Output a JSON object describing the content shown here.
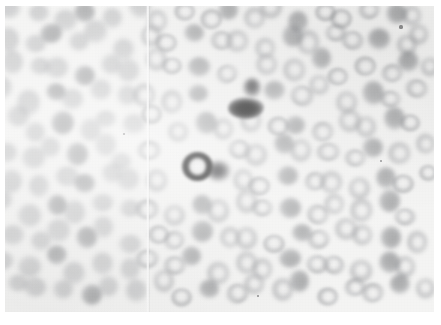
{
  "image": {
    "kind": "micrograph",
    "subject": "peripheral blood smear",
    "modality": "light microscopy, stained film",
    "rendering": "grayscale",
    "width_px": 441,
    "height_px": 325,
    "caption": "",
    "title": "",
    "visible_text": []
  },
  "colors": {
    "page_background": "#ffffff",
    "field_background": "#f7f7f6",
    "cell_light": "#9a9c9f",
    "cell_mid": "#7a7c80",
    "cell_dense": "#606266",
    "cell_dark": "#1b1b1b",
    "seam_highlight": "#ffffff"
  },
  "plate": {
    "left_px": 5,
    "top_px": 6,
    "width_px": 429,
    "height_px": 306,
    "margin_note": "thin white paper border on all four sides"
  },
  "artifacts": {
    "seam": {
      "name": "vertical-scan-seam",
      "x_px": 146,
      "width_px": 4,
      "description": "faint pale vertical crease running the full height of the plate"
    },
    "focus": "left third of the field is out of focus; right side is sharper",
    "specks": [
      {
        "x": 401,
        "y": 27,
        "r": 1.6
      },
      {
        "x": 381,
        "y": 161,
        "r": 1.3
      },
      {
        "x": 124,
        "y": 134,
        "r": 1.2
      },
      {
        "x": 258,
        "y": 296,
        "r": 1.4
      }
    ]
  },
  "features": {
    "dark_cells": [
      {
        "name": "upper-dark-cell",
        "label": "hyperchromic cell (upper)",
        "center_x": 246,
        "center_y": 108,
        "width": 36,
        "height": 22,
        "intensity": "near-black",
        "has_tail": true,
        "tail_x": 252,
        "tail_y": 88,
        "tail_w": 18,
        "tail_h": 20
      },
      {
        "name": "lower-dark-cell",
        "label": "hyperchromic ring cell (lower)",
        "center_x": 197,
        "center_y": 166,
        "width": 31,
        "height": 29,
        "intensity": "near-black with pale centre",
        "has_tail": true,
        "tail_x": 219,
        "tail_y": 171,
        "tail_w": 24,
        "tail_h": 20
      }
    ],
    "erythrocyte_count_visible": 168,
    "mean_cell_diameter_px": 21
  },
  "cells": [
    {
      "x": 14,
      "y": 14,
      "d": 22,
      "t": "soft"
    },
    {
      "x": 40,
      "y": 9,
      "d": 20,
      "t": "soft"
    },
    {
      "x": 62,
      "y": 18,
      "d": 23,
      "t": "soft"
    },
    {
      "x": 88,
      "y": 12,
      "d": 21,
      "t": "dense"
    },
    {
      "x": 112,
      "y": 20,
      "d": 20,
      "t": "soft"
    },
    {
      "x": 136,
      "y": 10,
      "d": 22,
      "t": "soft"
    },
    {
      "x": 160,
      "y": 16,
      "d": 20,
      "t": "ring"
    },
    {
      "x": 183,
      "y": 8,
      "d": 21,
      "t": "ring"
    },
    {
      "x": 206,
      "y": 18,
      "d": 22,
      "t": "ring"
    },
    {
      "x": 230,
      "y": 11,
      "d": 20,
      "t": "dense"
    },
    {
      "x": 252,
      "y": 20,
      "d": 21,
      "t": "ring"
    },
    {
      "x": 276,
      "y": 12,
      "d": 22,
      "t": "ring"
    },
    {
      "x": 299,
      "y": 18,
      "d": 20,
      "t": "dense"
    },
    {
      "x": 322,
      "y": 10,
      "d": 21,
      "t": "ring"
    },
    {
      "x": 345,
      "y": 19,
      "d": 22,
      "t": "ring"
    },
    {
      "x": 369,
      "y": 12,
      "d": 20,
      "t": "ring"
    },
    {
      "x": 392,
      "y": 17,
      "d": 21,
      "t": "dense"
    },
    {
      "x": 414,
      "y": 10,
      "d": 19,
      "t": "ring"
    },
    {
      "x": 6,
      "y": 36,
      "d": 23,
      "t": "soft"
    },
    {
      "x": 30,
      "y": 42,
      "d": 21,
      "t": "soft"
    },
    {
      "x": 53,
      "y": 34,
      "d": 22,
      "t": "dense"
    },
    {
      "x": 77,
      "y": 44,
      "d": 20,
      "t": "soft"
    },
    {
      "x": 100,
      "y": 36,
      "d": 23,
      "t": "soft"
    },
    {
      "x": 124,
      "y": 45,
      "d": 21,
      "t": "soft"
    },
    {
      "x": 148,
      "y": 34,
      "d": 20,
      "t": "ring"
    },
    {
      "x": 170,
      "y": 43,
      "d": 22,
      "t": "ring"
    },
    {
      "x": 194,
      "y": 35,
      "d": 20,
      "t": "dense"
    },
    {
      "x": 217,
      "y": 44,
      "d": 21,
      "t": "ring"
    },
    {
      "x": 240,
      "y": 36,
      "d": 22,
      "t": "ring"
    },
    {
      "x": 264,
      "y": 45,
      "d": 20,
      "t": "ring"
    },
    {
      "x": 287,
      "y": 34,
      "d": 21,
      "t": "dense"
    },
    {
      "x": 310,
      "y": 43,
      "d": 22,
      "t": "ring"
    },
    {
      "x": 334,
      "y": 36,
      "d": 20,
      "t": "ring"
    },
    {
      "x": 357,
      "y": 45,
      "d": 21,
      "t": "ring"
    },
    {
      "x": 380,
      "y": 35,
      "d": 22,
      "t": "dense"
    },
    {
      "x": 404,
      "y": 43,
      "d": 20,
      "t": "ring"
    },
    {
      "x": 422,
      "y": 34,
      "d": 19,
      "t": "ring"
    },
    {
      "x": 12,
      "y": 64,
      "d": 22,
      "t": "soft"
    },
    {
      "x": 36,
      "y": 70,
      "d": 20,
      "t": "soft"
    },
    {
      "x": 59,
      "y": 62,
      "d": 23,
      "t": "soft"
    },
    {
      "x": 83,
      "y": 72,
      "d": 21,
      "t": "dense"
    },
    {
      "x": 106,
      "y": 63,
      "d": 20,
      "t": "soft"
    },
    {
      "x": 130,
      "y": 71,
      "d": 22,
      "t": "soft"
    },
    {
      "x": 154,
      "y": 62,
      "d": 21,
      "t": "ring"
    },
    {
      "x": 177,
      "y": 71,
      "d": 20,
      "t": "ring"
    },
    {
      "x": 200,
      "y": 63,
      "d": 22,
      "t": "dense"
    },
    {
      "x": 224,
      "y": 72,
      "d": 20,
      "t": "ring"
    },
    {
      "x": 270,
      "y": 64,
      "d": 21,
      "t": "ring"
    },
    {
      "x": 294,
      "y": 72,
      "d": 22,
      "t": "ring"
    },
    {
      "x": 317,
      "y": 62,
      "d": 20,
      "t": "dense"
    },
    {
      "x": 340,
      "y": 71,
      "d": 21,
      "t": "ring"
    },
    {
      "x": 364,
      "y": 63,
      "d": 22,
      "t": "ring"
    },
    {
      "x": 387,
      "y": 72,
      "d": 20,
      "t": "ring"
    },
    {
      "x": 410,
      "y": 62,
      "d": 21,
      "t": "dense"
    },
    {
      "x": 428,
      "y": 70,
      "d": 18,
      "t": "ring"
    },
    {
      "x": 6,
      "y": 92,
      "d": 21,
      "t": "soft"
    },
    {
      "x": 29,
      "y": 98,
      "d": 23,
      "t": "soft"
    },
    {
      "x": 53,
      "y": 90,
      "d": 20,
      "t": "dense"
    },
    {
      "x": 76,
      "y": 99,
      "d": 22,
      "t": "soft"
    },
    {
      "x": 100,
      "y": 91,
      "d": 21,
      "t": "soft"
    },
    {
      "x": 123,
      "y": 99,
      "d": 20,
      "t": "soft"
    },
    {
      "x": 147,
      "y": 90,
      "d": 22,
      "t": "ring"
    },
    {
      "x": 170,
      "y": 98,
      "d": 21,
      "t": "ring"
    },
    {
      "x": 193,
      "y": 92,
      "d": 20,
      "t": "dense"
    },
    {
      "x": 276,
      "y": 91,
      "d": 21,
      "t": "dense"
    },
    {
      "x": 300,
      "y": 99,
      "d": 22,
      "t": "ring"
    },
    {
      "x": 324,
      "y": 90,
      "d": 20,
      "t": "ring"
    },
    {
      "x": 347,
      "y": 98,
      "d": 21,
      "t": "ring"
    },
    {
      "x": 370,
      "y": 91,
      "d": 22,
      "t": "dense"
    },
    {
      "x": 394,
      "y": 99,
      "d": 20,
      "t": "ring"
    },
    {
      "x": 416,
      "y": 90,
      "d": 21,
      "t": "ring"
    },
    {
      "x": 14,
      "y": 120,
      "d": 22,
      "t": "soft"
    },
    {
      "x": 38,
      "y": 127,
      "d": 20,
      "t": "soft"
    },
    {
      "x": 61,
      "y": 119,
      "d": 23,
      "t": "dense"
    },
    {
      "x": 85,
      "y": 128,
      "d": 21,
      "t": "soft"
    },
    {
      "x": 108,
      "y": 120,
      "d": 20,
      "t": "soft"
    },
    {
      "x": 132,
      "y": 127,
      "d": 22,
      "t": "soft"
    },
    {
      "x": 156,
      "y": 119,
      "d": 21,
      "t": "ring"
    },
    {
      "x": 179,
      "y": 128,
      "d": 20,
      "t": "ring"
    },
    {
      "x": 203,
      "y": 121,
      "d": 22,
      "t": "dense"
    },
    {
      "x": 227,
      "y": 129,
      "d": 20,
      "t": "ring"
    },
    {
      "x": 250,
      "y": 122,
      "d": 21,
      "t": "ring"
    },
    {
      "x": 274,
      "y": 130,
      "d": 22,
      "t": "ring"
    },
    {
      "x": 298,
      "y": 120,
      "d": 20,
      "t": "dense"
    },
    {
      "x": 321,
      "y": 128,
      "d": 21,
      "t": "ring"
    },
    {
      "x": 345,
      "y": 120,
      "d": 22,
      "t": "ring"
    },
    {
      "x": 368,
      "y": 128,
      "d": 20,
      "t": "ring"
    },
    {
      "x": 392,
      "y": 121,
      "d": 21,
      "t": "dense"
    },
    {
      "x": 415,
      "y": 128,
      "d": 20,
      "t": "ring"
    },
    {
      "x": 7,
      "y": 148,
      "d": 21,
      "t": "soft"
    },
    {
      "x": 30,
      "y": 155,
      "d": 23,
      "t": "soft"
    },
    {
      "x": 54,
      "y": 147,
      "d": 20,
      "t": "soft"
    },
    {
      "x": 77,
      "y": 156,
      "d": 22,
      "t": "dense"
    },
    {
      "x": 101,
      "y": 148,
      "d": 21,
      "t": "soft"
    },
    {
      "x": 124,
      "y": 156,
      "d": 20,
      "t": "soft"
    },
    {
      "x": 148,
      "y": 147,
      "d": 22,
      "t": "ring"
    },
    {
      "x": 234,
      "y": 148,
      "d": 21,
      "t": "ring"
    },
    {
      "x": 258,
      "y": 156,
      "d": 22,
      "t": "ring"
    },
    {
      "x": 282,
      "y": 147,
      "d": 20,
      "t": "dense"
    },
    {
      "x": 305,
      "y": 155,
      "d": 21,
      "t": "ring"
    },
    {
      "x": 329,
      "y": 148,
      "d": 22,
      "t": "ring"
    },
    {
      "x": 352,
      "y": 156,
      "d": 20,
      "t": "ring"
    },
    {
      "x": 376,
      "y": 147,
      "d": 21,
      "t": "dense"
    },
    {
      "x": 399,
      "y": 155,
      "d": 22,
      "t": "ring"
    },
    {
      "x": 421,
      "y": 147,
      "d": 19,
      "t": "ring"
    },
    {
      "x": 14,
      "y": 176,
      "d": 22,
      "t": "soft"
    },
    {
      "x": 38,
      "y": 183,
      "d": 20,
      "t": "soft"
    },
    {
      "x": 62,
      "y": 175,
      "d": 23,
      "t": "soft"
    },
    {
      "x": 86,
      "y": 184,
      "d": 21,
      "t": "dense"
    },
    {
      "x": 110,
      "y": 176,
      "d": 20,
      "t": "soft"
    },
    {
      "x": 133,
      "y": 184,
      "d": 22,
      "t": "soft"
    },
    {
      "x": 157,
      "y": 176,
      "d": 21,
      "t": "ring"
    },
    {
      "x": 240,
      "y": 178,
      "d": 20,
      "t": "ring"
    },
    {
      "x": 263,
      "y": 186,
      "d": 22,
      "t": "ring"
    },
    {
      "x": 287,
      "y": 177,
      "d": 21,
      "t": "dense"
    },
    {
      "x": 311,
      "y": 185,
      "d": 20,
      "t": "ring"
    },
    {
      "x": 334,
      "y": 177,
      "d": 22,
      "t": "ring"
    },
    {
      "x": 358,
      "y": 185,
      "d": 21,
      "t": "ring"
    },
    {
      "x": 381,
      "y": 177,
      "d": 20,
      "t": "dense"
    },
    {
      "x": 405,
      "y": 185,
      "d": 22,
      "t": "ring"
    },
    {
      "x": 426,
      "y": 176,
      "d": 18,
      "t": "ring"
    },
    {
      "x": 6,
      "y": 204,
      "d": 21,
      "t": "soft"
    },
    {
      "x": 30,
      "y": 211,
      "d": 23,
      "t": "soft"
    },
    {
      "x": 54,
      "y": 203,
      "d": 20,
      "t": "dense"
    },
    {
      "x": 78,
      "y": 212,
      "d": 22,
      "t": "soft"
    },
    {
      "x": 102,
      "y": 204,
      "d": 21,
      "t": "soft"
    },
    {
      "x": 126,
      "y": 212,
      "d": 20,
      "t": "soft"
    },
    {
      "x": 150,
      "y": 204,
      "d": 22,
      "t": "ring"
    },
    {
      "x": 173,
      "y": 212,
      "d": 21,
      "t": "ring"
    },
    {
      "x": 197,
      "y": 204,
      "d": 20,
      "t": "dense"
    },
    {
      "x": 220,
      "y": 212,
      "d": 22,
      "t": "ring"
    },
    {
      "x": 244,
      "y": 204,
      "d": 21,
      "t": "ring"
    },
    {
      "x": 267,
      "y": 213,
      "d": 20,
      "t": "ring"
    },
    {
      "x": 291,
      "y": 204,
      "d": 22,
      "t": "dense"
    },
    {
      "x": 314,
      "y": 212,
      "d": 21,
      "t": "ring"
    },
    {
      "x": 338,
      "y": 204,
      "d": 20,
      "t": "ring"
    },
    {
      "x": 361,
      "y": 212,
      "d": 22,
      "t": "ring"
    },
    {
      "x": 385,
      "y": 204,
      "d": 21,
      "t": "dense"
    },
    {
      "x": 408,
      "y": 212,
      "d": 20,
      "t": "ring"
    },
    {
      "x": 12,
      "y": 232,
      "d": 22,
      "t": "soft"
    },
    {
      "x": 36,
      "y": 240,
      "d": 20,
      "t": "soft"
    },
    {
      "x": 60,
      "y": 231,
      "d": 23,
      "t": "soft"
    },
    {
      "x": 84,
      "y": 240,
      "d": 21,
      "t": "dense"
    },
    {
      "x": 108,
      "y": 232,
      "d": 20,
      "t": "soft"
    },
    {
      "x": 131,
      "y": 240,
      "d": 22,
      "t": "soft"
    },
    {
      "x": 155,
      "y": 232,
      "d": 21,
      "t": "ring"
    },
    {
      "x": 178,
      "y": 240,
      "d": 20,
      "t": "ring"
    },
    {
      "x": 202,
      "y": 233,
      "d": 22,
      "t": "dense"
    },
    {
      "x": 226,
      "y": 241,
      "d": 20,
      "t": "ring"
    },
    {
      "x": 249,
      "y": 233,
      "d": 21,
      "t": "ring"
    },
    {
      "x": 273,
      "y": 241,
      "d": 22,
      "t": "ring"
    },
    {
      "x": 297,
      "y": 232,
      "d": 20,
      "t": "dense"
    },
    {
      "x": 320,
      "y": 240,
      "d": 21,
      "t": "ring"
    },
    {
      "x": 344,
      "y": 232,
      "d": 22,
      "t": "ring"
    },
    {
      "x": 367,
      "y": 240,
      "d": 20,
      "t": "ring"
    },
    {
      "x": 391,
      "y": 233,
      "d": 21,
      "t": "dense"
    },
    {
      "x": 414,
      "y": 240,
      "d": 20,
      "t": "ring"
    },
    {
      "x": 6,
      "y": 260,
      "d": 21,
      "t": "soft"
    },
    {
      "x": 29,
      "y": 268,
      "d": 23,
      "t": "soft"
    },
    {
      "x": 53,
      "y": 259,
      "d": 20,
      "t": "dense"
    },
    {
      "x": 77,
      "y": 268,
      "d": 22,
      "t": "soft"
    },
    {
      "x": 101,
      "y": 260,
      "d": 21,
      "t": "soft"
    },
    {
      "x": 125,
      "y": 268,
      "d": 20,
      "t": "soft"
    },
    {
      "x": 149,
      "y": 260,
      "d": 22,
      "t": "ring"
    },
    {
      "x": 172,
      "y": 268,
      "d": 21,
      "t": "ring"
    },
    {
      "x": 196,
      "y": 261,
      "d": 20,
      "t": "dense"
    },
    {
      "x": 219,
      "y": 269,
      "d": 22,
      "t": "ring"
    },
    {
      "x": 243,
      "y": 260,
      "d": 21,
      "t": "ring"
    },
    {
      "x": 266,
      "y": 269,
      "d": 20,
      "t": "ring"
    },
    {
      "x": 290,
      "y": 260,
      "d": 22,
      "t": "dense"
    },
    {
      "x": 313,
      "y": 268,
      "d": 21,
      "t": "ring"
    },
    {
      "x": 337,
      "y": 260,
      "d": 20,
      "t": "ring"
    },
    {
      "x": 360,
      "y": 268,
      "d": 22,
      "t": "ring"
    },
    {
      "x": 384,
      "y": 261,
      "d": 21,
      "t": "dense"
    },
    {
      "x": 407,
      "y": 268,
      "d": 20,
      "t": "ring"
    },
    {
      "x": 16,
      "y": 286,
      "d": 20,
      "t": "soft"
    },
    {
      "x": 40,
      "y": 292,
      "d": 22,
      "t": "soft"
    },
    {
      "x": 64,
      "y": 285,
      "d": 20,
      "t": "soft"
    },
    {
      "x": 88,
      "y": 292,
      "d": 21,
      "t": "dense"
    },
    {
      "x": 112,
      "y": 286,
      "d": 20,
      "t": "soft"
    },
    {
      "x": 136,
      "y": 292,
      "d": 21,
      "t": "soft"
    },
    {
      "x": 160,
      "y": 285,
      "d": 20,
      "t": "ring"
    },
    {
      "x": 184,
      "y": 292,
      "d": 21,
      "t": "ring"
    },
    {
      "x": 208,
      "y": 286,
      "d": 20,
      "t": "dense"
    },
    {
      "x": 232,
      "y": 292,
      "d": 21,
      "t": "ring"
    },
    {
      "x": 256,
      "y": 285,
      "d": 20,
      "t": "ring"
    },
    {
      "x": 280,
      "y": 292,
      "d": 21,
      "t": "ring"
    },
    {
      "x": 304,
      "y": 286,
      "d": 20,
      "t": "dense"
    },
    {
      "x": 328,
      "y": 292,
      "d": 21,
      "t": "ring"
    },
    {
      "x": 352,
      "y": 285,
      "d": 20,
      "t": "ring"
    },
    {
      "x": 376,
      "y": 292,
      "d": 21,
      "t": "ring"
    },
    {
      "x": 400,
      "y": 286,
      "d": 20,
      "t": "dense"
    },
    {
      "x": 421,
      "y": 292,
      "d": 19,
      "t": "ring"
    }
  ]
}
